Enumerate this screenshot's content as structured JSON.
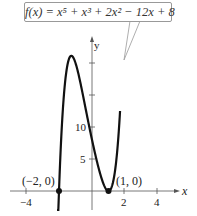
{
  "chart_data": {
    "type": "line",
    "title": "",
    "function": "f(x) = x^5 + x^3 + 2x^2 - 12x + 8",
    "xlabel": "x",
    "ylabel": "y",
    "xlim": [
      -4.0,
      5.0
    ],
    "ylim": [
      -1.5,
      29
    ],
    "x_ticks": [
      -4,
      2,
      4
    ],
    "x_tick_labels": [
      "-4",
      "2",
      "4"
    ],
    "y_ticks": [
      5,
      10,
      15,
      20,
      25
    ],
    "y_tick_labels": [
      "5",
      "10"
    ],
    "grid": false,
    "points": [
      {
        "label": "(-2, 0)",
        "x": -2,
        "y": 0
      },
      {
        "label": "(1, 0)",
        "x": 1,
        "y": 0
      }
    ],
    "series": [
      {
        "name": "f(x)",
        "x": [
          -2.1,
          -2.0,
          -1.8,
          -1.6,
          -1.4,
          -1.2,
          -1.0,
          -0.8,
          -0.5,
          0,
          0.5,
          0.8,
          1.0,
          1.2,
          1.4,
          1.6,
          1.7
        ],
        "values": [
          -5.6,
          0,
          10.1,
          16.3,
          19.7,
          20.9,
          19.0,
          17.1,
          13.6,
          8,
          3.1,
          0.7,
          0,
          1.2,
          5.6,
          15.8,
          22.1
        ]
      }
    ],
    "annotation": "f(x) = x⁵ + x³ + 2x² − 12x + 8"
  },
  "labels": {
    "equation": "f(x) = x⁵ + x³ + 2x² − 12x + 8",
    "x_axis": "x",
    "y_axis": "y",
    "tick_neg4": "−4",
    "tick_2": "2",
    "tick_4": "4",
    "tick_5": "5",
    "tick_10": "10",
    "point_left": "(−2, 0)",
    "point_right": "(1, 0)"
  }
}
